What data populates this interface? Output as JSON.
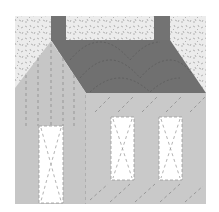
{
  "image": {
    "subject": "house quilt block",
    "colors": {
      "background": "#ffffff",
      "sky": "#ececec",
      "sky_speckle": "#9a9a9a",
      "roof": "#707070",
      "chimney": "#737373",
      "gable": "#c6c6c6",
      "wall": "#c9c9c9",
      "door": "#ffffff",
      "window": "#ffffff",
      "stitch": "#8c8c8c"
    }
  }
}
